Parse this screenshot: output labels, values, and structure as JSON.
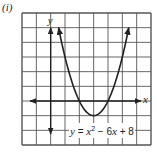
{
  "panel_label": "(i)",
  "chart_data": {
    "type": "line",
    "title": "",
    "equation": "y = x^2 - 6x + 8",
    "equation_parts": {
      "y": "y",
      "eq": " = ",
      "x1": "x",
      "exp": "2",
      "mid": " − 6",
      "x2": "x",
      "tail": " + 8"
    },
    "xlabel": "x",
    "ylabel": "y",
    "xlim": [
      -2,
      7
    ],
    "ylim": [
      -3,
      6
    ],
    "grid": true,
    "grid_step": 1,
    "tick_labels": false,
    "series": [
      {
        "name": "y = x^2 - 6x + 8",
        "function": "x^2 - 6x + 8",
        "x": [
          0.55,
          1,
          1.5,
          2,
          2.5,
          3,
          3.5,
          4,
          4.5,
          5,
          5.45
        ],
        "y": [
          5,
          3,
          1.25,
          0,
          -0.75,
          -1,
          -0.75,
          0,
          1.25,
          3,
          5
        ],
        "vertex": [
          3,
          -1
        ],
        "roots": [
          2,
          4
        ],
        "arrows_both_ends": true
      }
    ]
  },
  "colors": {
    "grid": "#555555",
    "axis": "#222222",
    "curve": "#222222",
    "background": "#ffffff"
  }
}
